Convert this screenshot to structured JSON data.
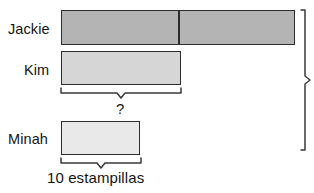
{
  "diagram": {
    "kind": "tape-diagram",
    "width": 314,
    "height": 193,
    "background": "#ffffff",
    "outline_color": "#2c2c2c"
  },
  "rows": [
    {
      "label": "Jackie",
      "bar_fill": "#b4b4b4",
      "segments": 2,
      "unit_label": "",
      "relative_length": "2 equal parts (twice Kim's bar)"
    },
    {
      "label": "Kim",
      "bar_fill": "#d6d6d6",
      "segments": 1,
      "unit_label": "",
      "relative_length": "1 part"
    },
    {
      "label": "Minah",
      "bar_fill": "#e9e9e9",
      "segments": 1,
      "unit_label": "",
      "relative_length": "10 estampillas"
    }
  ],
  "annotations": {
    "kim_brace_label": "?",
    "minah_brace_label": "10 estampillas",
    "total_bracket_label": ""
  },
  "colors": {
    "jackie_fill": "#b4b4b4",
    "kim_fill": "#d6d6d6",
    "minah_fill": "#e9e9e9",
    "stroke": "#2c2c2c",
    "brace_stroke": "#3a3a3a",
    "text": "#141414"
  }
}
